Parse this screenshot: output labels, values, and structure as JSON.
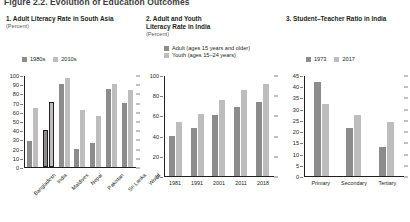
{
  "figure": {
    "title": "Figure 2.2. Evolution of Education Outcomes"
  },
  "colors": {
    "dark": "#8c8c8c",
    "light": "#bdbdbd",
    "axis": "#231f20",
    "subtitle": "#58595b"
  },
  "panels": [
    {
      "id": "panel-1",
      "title": "1. Adult Literacy Rate in South Asia",
      "subtitle": "(Percent)",
      "legend": [
        {
          "label": "1980s",
          "color": "#8c8c8c"
        },
        {
          "label": "2010s",
          "color": "#bdbdbd"
        }
      ]
    },
    {
      "id": "panel-2",
      "title_line1": "2. Adult and Youth",
      "title_line2": "Literacy Rate in India",
      "subtitle": "(Percent)",
      "legend": [
        {
          "label": "Adult (ages 15 years and older)",
          "color": "#8c8c8c"
        },
        {
          "label": "Youth (ages 15–24 years)",
          "color": "#bdbdbd"
        }
      ]
    },
    {
      "id": "panel-3",
      "title": "3. Student–Teacher Ratio in India",
      "subtitle": "",
      "legend": [
        {
          "label": "1973",
          "color": "#8c8c8c"
        },
        {
          "label": "2017",
          "color": "#bdbdbd"
        }
      ]
    }
  ],
  "chart_data": [
    {
      "type": "bar",
      "title": "1. Adult Literacy Rate in South Asia",
      "xlabel": "",
      "ylabel": "Percent",
      "ylim": [
        0,
        100
      ],
      "yticks": [
        0,
        10,
        20,
        30,
        40,
        50,
        60,
        70,
        80,
        90,
        100
      ],
      "grid": false,
      "legend_position": "top",
      "categories": [
        "Bangladesh",
        "India",
        "Maldives",
        "Nepal",
        "Pakistan",
        "Sri Lanka",
        "World"
      ],
      "series": [
        {
          "name": "1980s",
          "color": "#8c8c8c",
          "values": [
            29,
            41,
            91,
            20,
            26,
            86,
            70
          ]
        },
        {
          "name": "2010s",
          "color": "#bdbdbd",
          "values": [
            65,
            71,
            98,
            63,
            56,
            91,
            85
          ]
        }
      ],
      "highlighted_category": "India"
    },
    {
      "type": "bar",
      "title": "2. Adult and Youth Literacy Rate in India",
      "xlabel": "",
      "ylabel": "Percent",
      "ylim": [
        0,
        100
      ],
      "yticks": [
        0,
        20,
        40,
        60,
        80,
        100
      ],
      "grid": false,
      "legend_position": "top",
      "categories": [
        "1981",
        "1991",
        "2001",
        "2011",
        "2018"
      ],
      "series": [
        {
          "name": "Adult (ages 15 years and older)",
          "color": "#8c8c8c",
          "values": [
            40,
            48,
            61,
            69,
            74
          ]
        },
        {
          "name": "Youth (ages 15–24 years)",
          "color": "#bdbdbd",
          "values": [
            54,
            62,
            76,
            86,
            92
          ]
        }
      ]
    },
    {
      "type": "bar",
      "title": "3. Student–Teacher Ratio in India",
      "xlabel": "",
      "ylabel": "",
      "ylim": [
        0,
        45
      ],
      "yticks": [
        0,
        5,
        10,
        15,
        20,
        25,
        30,
        35,
        40,
        45
      ],
      "grid": false,
      "legend_position": "top",
      "categories": [
        "Primary",
        "Secondary",
        "Tertiary"
      ],
      "series": [
        {
          "name": "1973",
          "color": "#8c8c8c",
          "values": [
            42.5,
            21.5,
            13
          ]
        },
        {
          "name": "2017",
          "color": "#bdbdbd",
          "values": [
            32.5,
            27.5,
            24.5
          ]
        }
      ]
    }
  ]
}
